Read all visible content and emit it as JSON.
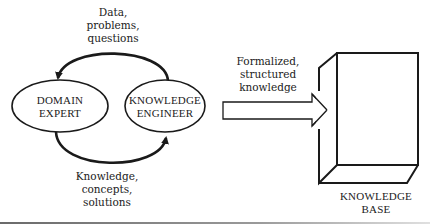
{
  "diagram": {
    "nodes": {
      "domain_expert": {
        "line1": "DOMAIN",
        "line2": "EXPERT"
      },
      "knowledge_engineer": {
        "line1": "KNOWLEDGE",
        "line2": "ENGINEER"
      },
      "knowledge_base": {
        "line1": "KNOWLEDGE",
        "line2": "BASE"
      }
    },
    "edges": {
      "engineer_to_expert": {
        "line1": "Data,",
        "line2": "problems,",
        "line3": "questions"
      },
      "expert_to_engineer": {
        "line1": "Knowledge,",
        "line2": "concepts,",
        "line3": "solutions"
      },
      "engineer_to_base": {
        "line1": "Formalized,",
        "line2": "structured",
        "line3": "knowledge"
      }
    }
  },
  "colors": {
    "stroke": "#1a1a1a",
    "text": "#222222",
    "rule": "#8a8a8a",
    "background": "#ffffff"
  }
}
